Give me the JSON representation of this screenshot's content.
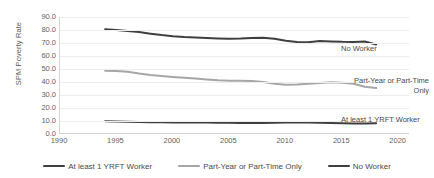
{
  "chart_data": {
    "type": "line",
    "title": "",
    "xlabel": "",
    "ylabel": "SPM Poverty Rate",
    "xlim": [
      1990,
      2021
    ],
    "ylim": [
      0.0,
      90.0
    ],
    "grid": true,
    "legend_position": "bottom",
    "x_ticks": [
      "1990",
      "1995",
      "2000",
      "2005",
      "2010",
      "2015",
      "2020"
    ],
    "y_ticks": [
      "90.0",
      "80.0",
      "70.0",
      "60.0",
      "50.0",
      "40.0",
      "30.0",
      "20.0",
      "10.0",
      "0.0"
    ],
    "x": [
      1994,
      1995,
      1996,
      1997,
      1998,
      1999,
      2000,
      2001,
      2002,
      2003,
      2004,
      2005,
      2006,
      2007,
      2008,
      2009,
      2010,
      2011,
      2012,
      2013,
      2014,
      2015,
      2016,
      2017,
      2018
    ],
    "series": [
      {
        "name": "No Worker",
        "color": "#3f3f3f",
        "values": [
          80.6,
          80.0,
          79.2,
          78.4,
          77.2,
          76.1,
          75.2,
          74.6,
          74.2,
          73.9,
          73.5,
          73.2,
          73.4,
          73.8,
          74.0,
          73.2,
          71.7,
          70.8,
          70.6,
          71.6,
          71.2,
          70.9,
          70.8,
          71.2,
          68.9
        ]
      },
      {
        "name": "Part-Year or Part-Time Only",
        "color": "#a6a6a6",
        "values": [
          48.6,
          48.5,
          47.8,
          46.5,
          45.4,
          44.6,
          43.9,
          43.3,
          42.7,
          42.0,
          41.4,
          41.0,
          40.9,
          40.8,
          40.0,
          38.7,
          37.9,
          38.0,
          38.6,
          39.2,
          39.8,
          39.5,
          38.7,
          36.3,
          35.3
        ]
      },
      {
        "name": "At least 1 YRFT Worker",
        "color": "#3f3f3f",
        "values": [
          9.9,
          9.7,
          9.5,
          9.3,
          9.1,
          9.0,
          8.9,
          8.9,
          8.9,
          8.8,
          8.7,
          8.6,
          8.5,
          8.4,
          8.5,
          8.6,
          8.8,
          8.9,
          8.9,
          8.7,
          8.4,
          8.2,
          8.0,
          8.1,
          8.2
        ]
      }
    ],
    "annotations": [
      {
        "id": "no-worker",
        "text": "No Worker"
      },
      {
        "id": "part-year",
        "text": "Part-Year or Part-Time Only"
      },
      {
        "id": "yrft",
        "text": "At least 1 YRFT Worker"
      }
    ],
    "legend": [
      {
        "label": "At least 1 YRFT Worker",
        "color": "#3f3f3f"
      },
      {
        "label": "Part-Year or Part-Time Only",
        "color": "#a6a6a6"
      },
      {
        "label": "No Worker",
        "color": "#3f3f3f"
      }
    ]
  }
}
